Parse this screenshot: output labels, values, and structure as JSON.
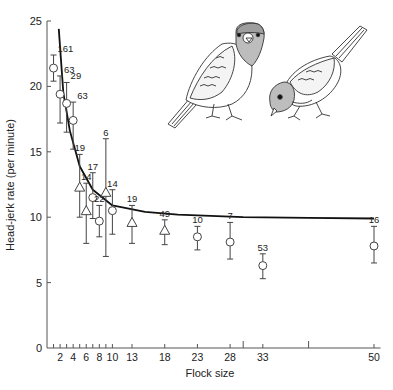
{
  "chart_data": {
    "type": "scatter",
    "title": "",
    "xlabel": "Flock size",
    "ylabel": "Head-jerk rate (per minute)",
    "xlim": [
      0,
      51
    ],
    "ylim": [
      0,
      25
    ],
    "grid": false,
    "legend": "none",
    "x_ticks_labeled": [
      2,
      4,
      6,
      8,
      10,
      13,
      18,
      23,
      28,
      33,
      50
    ],
    "x_ticks_minor": [
      1,
      3,
      5,
      7,
      9
    ],
    "x_ticks_unlabeled": [
      30,
      40
    ],
    "y_ticks": [
      0,
      5,
      10,
      15,
      20,
      25
    ],
    "fit_curve": {
      "description": "decreasing hyperbolic fit",
      "points": [
        [
          1.8,
          24.4
        ],
        [
          2.5,
          19.5
        ],
        [
          3.5,
          16.6
        ],
        [
          5,
          13.9
        ],
        [
          7,
          12.1
        ],
        [
          10,
          10.9
        ],
        [
          15,
          10.4
        ],
        [
          20,
          10.2
        ],
        [
          30,
          10.0
        ],
        [
          40,
          9.95
        ],
        [
          50,
          9.9
        ]
      ]
    },
    "series": [
      {
        "name": "circles",
        "marker": "circle",
        "points": [
          {
            "x": 1,
            "y": 21.4,
            "lo": 20.4,
            "hi": 22.4,
            "n": "161"
          },
          {
            "x": 2,
            "y": 19.4,
            "lo": 17.2,
            "hi": 20.8,
            "n": "63"
          },
          {
            "x": 3,
            "y": 18.7,
            "lo": 16.5,
            "hi": 20.3,
            "n": "29"
          },
          {
            "x": 4,
            "y": 17.4,
            "lo": 15.2,
            "hi": 18.8,
            "n": "63"
          },
          {
            "x": 7,
            "y": 11.5,
            "lo": 9.9,
            "hi": 13.4,
            "n": "17"
          },
          {
            "x": 8,
            "y": 9.7,
            "lo": 8.5,
            "hi": 10.9,
            "n": "22"
          },
          {
            "x": 10,
            "y": 10.5,
            "lo": 8.7,
            "hi": 12.1,
            "n": "14"
          },
          {
            "x": 23,
            "y": 8.5,
            "lo": 7.5,
            "hi": 9.3,
            "n": "10"
          },
          {
            "x": 28,
            "y": 8.1,
            "lo": 6.8,
            "hi": 9.6,
            "n": "7"
          },
          {
            "x": 33,
            "y": 6.3,
            "lo": 5.3,
            "hi": 7.2,
            "n": "53"
          },
          {
            "x": 50,
            "y": 7.8,
            "lo": 6.5,
            "hi": 9.3,
            "n": "16"
          }
        ]
      },
      {
        "name": "triangles",
        "marker": "triangle",
        "points": [
          {
            "x": 5,
            "y": 12.3,
            "lo": 10.0,
            "hi": 14.8,
            "n": "19"
          },
          {
            "x": 6,
            "y": 10.5,
            "lo": 8.0,
            "hi": 12.6,
            "n": "14"
          },
          {
            "x": 9,
            "y": 11.9,
            "lo": 7.0,
            "hi": 16.0,
            "n": "6"
          },
          {
            "x": 13,
            "y": 9.6,
            "lo": 8.0,
            "hi": 10.9,
            "n": "19"
          },
          {
            "x": 18,
            "y": 9.0,
            "lo": 7.9,
            "hi": 9.8,
            "n": "49"
          }
        ]
      }
    ],
    "annotations": [
      "Illustration of two sparrow-like birds: one standing alert, one feeding head-down"
    ]
  },
  "illustration": {
    "alert_bird": "standing alert bird",
    "feeding_bird": "feeding bird with head down"
  }
}
